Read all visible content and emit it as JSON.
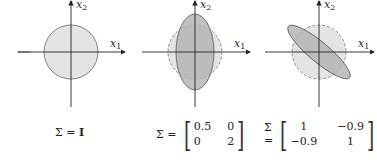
{
  "axes": {
    "x_label": "x",
    "x_sub": "1",
    "y_label": "x",
    "y_sub": "2"
  },
  "colors": {
    "light_fill": "#e4e4e4",
    "dark_fill": "#b5b5b5",
    "stroke": "#555555",
    "axis": "#222222"
  },
  "panels": [
    {
      "id": "identity",
      "equation_prefix": "Σ =",
      "equation_value": "I",
      "shape": "circle"
    },
    {
      "id": "diagonal",
      "equation_prefix": "Σ =",
      "matrix": [
        [
          "0.5",
          "0"
        ],
        [
          "0",
          "2"
        ]
      ],
      "shape": "vertical-ellipse"
    },
    {
      "id": "correlated",
      "equation_prefix": "Σ =",
      "matrix": [
        [
          "1",
          "−0.9"
        ],
        [
          "−0.9",
          "1"
        ]
      ],
      "shape": "rotated-ellipse"
    }
  ]
}
